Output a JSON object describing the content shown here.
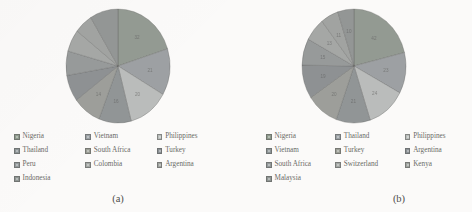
{
  "figure": {
    "background": "#fbfaf9",
    "panels": [
      {
        "caption": "(a)",
        "legend_columns": 3,
        "legend": [
          {
            "label": "Nigeria",
            "color": "#8e9a8c"
          },
          {
            "label": "Vietnam",
            "color": "#9aa0a4"
          },
          {
            "label": "Philippines",
            "color": "#b9bdbb"
          },
          {
            "label": "Thailand",
            "color": "#8c9496"
          },
          {
            "label": "South Africa",
            "color": "#9b9e96"
          },
          {
            "label": "Turkey",
            "color": "#8a9094"
          },
          {
            "label": "Peru",
            "color": "#93999a"
          },
          {
            "label": "Colombia",
            "color": "#a3a7a4"
          },
          {
            "label": "Argentina",
            "color": "#9fa39f"
          },
          {
            "label": "Indonesia",
            "color": "#8f9593"
          }
        ]
      },
      {
        "caption": "(b)",
        "legend_columns": 3,
        "legend": [
          {
            "label": "Nigeria",
            "color": "#8e9a8c"
          },
          {
            "label": "Thailand",
            "color": "#9aa0a4"
          },
          {
            "label": "Philippines",
            "color": "#b9bdbb"
          },
          {
            "label": "Vietnam",
            "color": "#8c9496"
          },
          {
            "label": "Turkey",
            "color": "#9b9e96"
          },
          {
            "label": "Argentina",
            "color": "#8a9094"
          },
          {
            "label": "South Africa",
            "color": "#93999a"
          },
          {
            "label": "Switzerland",
            "color": "#a3a7a4"
          },
          {
            "label": "Kenya",
            "color": "#9fa39f"
          },
          {
            "label": "Malaysia",
            "color": "#8f9593"
          }
        ]
      }
    ]
  },
  "chart_data": [
    {
      "type": "pie",
      "title": "(a)",
      "labels": [
        "Nigeria",
        "Vietnam",
        "Philippines",
        "Thailand",
        "South Africa",
        "Turkey",
        "Peru",
        "Colombia",
        "Argentina",
        "Indonesia"
      ],
      "values": [
        32,
        21,
        20,
        16,
        14,
        12,
        11,
        10,
        9,
        14
      ],
      "value_labels": [
        "32",
        "21",
        "20",
        "16",
        "14",
        "",
        "",
        "",
        "",
        ""
      ],
      "colors": [
        "#8e9a8c",
        "#9aa0a4",
        "#b9bdbb",
        "#8c9496",
        "#9b9e96",
        "#8a9094",
        "#93999a",
        "#a3a7a4",
        "#9fa39f",
        "#8f9593"
      ],
      "legend_position": "bottom",
      "start_angle": 0,
      "grid": false
    },
    {
      "type": "pie",
      "title": "(b)",
      "labels": [
        "Nigeria",
        "Thailand",
        "Philippines",
        "Vietnam",
        "Turkey",
        "Argentina",
        "South Africa",
        "Switzerland",
        "Kenya",
        "Malaysia"
      ],
      "values": [
        42,
        23,
        24,
        21,
        20,
        19,
        15,
        13,
        11,
        10
      ],
      "value_labels": [
        "42",
        "23",
        "24",
        "21",
        "20",
        "19",
        "15",
        "13",
        "11",
        "10"
      ],
      "colors": [
        "#8e9a8c",
        "#9aa0a4",
        "#b9bdbb",
        "#8c9496",
        "#9b9e96",
        "#8a9094",
        "#93999a",
        "#a3a7a4",
        "#9fa39f",
        "#8f9593"
      ],
      "legend_position": "bottom",
      "start_angle": 0,
      "grid": false
    }
  ]
}
